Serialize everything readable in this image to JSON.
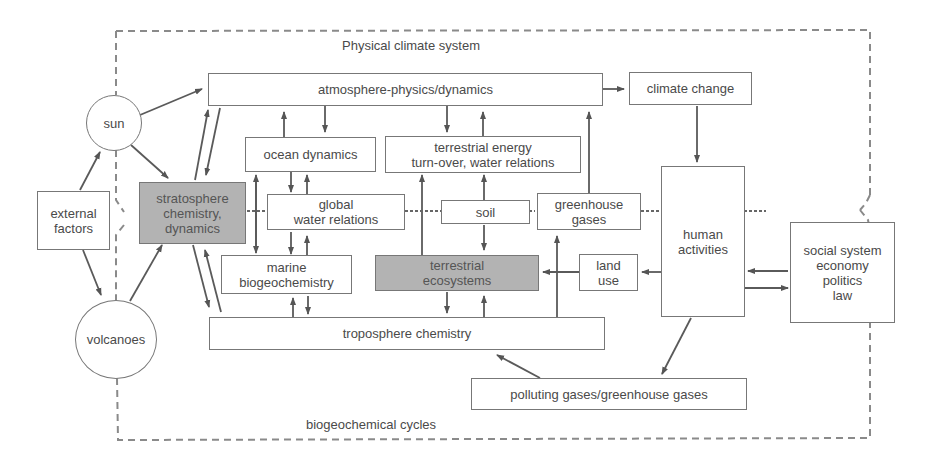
{
  "diagram": {
    "region_labels": {
      "top": "Physical climate system",
      "bottom": "biogeochemical cycles"
    },
    "nodes": {
      "sun": "sun",
      "volcanoes": "volcanoes",
      "external_factors": "external\nfactors",
      "stratosphere": "stratosphere\nchemistry,\ndynamics",
      "atmosphere": "atmosphere-physics/dynamics",
      "climate_change": "climate change",
      "ocean_dynamics": "ocean dynamics",
      "terrestrial_energy": "terrestrial energy\nturn-over, water relations",
      "global_water": "global\nwater relations",
      "soil": "soil",
      "greenhouse_gases": "greenhouse\ngases",
      "human_activities": "human\nactivities",
      "marine_bio": "marine\nbiogeochemistry",
      "terrestrial_eco": "terrestrial\necosystems",
      "land_use": "land\nuse",
      "troposphere": "troposphere chemistry",
      "polluting_gases": "polluting gases/greenhouse gases",
      "social_system": "social system\neconomy\npolitics\nlaw"
    },
    "colors": {
      "line": "#666666",
      "shaded_fill": "#b3b3b3",
      "border": "#777777"
    }
  }
}
